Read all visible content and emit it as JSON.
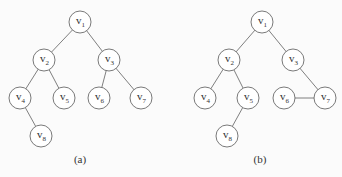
{
  "figures": [
    {
      "id": "a",
      "caption": "(a)",
      "caption_pos": [
        80,
        163
      ],
      "nodes": [
        {
          "id": "v1",
          "base": "v",
          "sub": "1",
          "x": 80,
          "y": 22
        },
        {
          "id": "v2",
          "base": "v",
          "sub": "2",
          "x": 44,
          "y": 60
        },
        {
          "id": "v3",
          "base": "v",
          "sub": "3",
          "x": 109,
          "y": 60
        },
        {
          "id": "v4",
          "base": "v",
          "sub": "4",
          "x": 20,
          "y": 98
        },
        {
          "id": "v5",
          "base": "v",
          "sub": "5",
          "x": 64,
          "y": 98
        },
        {
          "id": "v6",
          "base": "v",
          "sub": "6",
          "x": 99,
          "y": 98
        },
        {
          "id": "v7",
          "base": "v",
          "sub": "7",
          "x": 141,
          "y": 98
        },
        {
          "id": "v8",
          "base": "v",
          "sub": "8",
          "x": 41,
          "y": 136
        }
      ],
      "edges": [
        [
          "v1",
          "v2"
        ],
        [
          "v1",
          "v3"
        ],
        [
          "v2",
          "v4"
        ],
        [
          "v2",
          "v5"
        ],
        [
          "v3",
          "v6"
        ],
        [
          "v3",
          "v7"
        ],
        [
          "v4",
          "v8"
        ]
      ]
    },
    {
      "id": "b",
      "caption": "(b)",
      "caption_pos": [
        260,
        163
      ],
      "nodes": [
        {
          "id": "v1",
          "base": "v",
          "sub": "1",
          "x": 262,
          "y": 22
        },
        {
          "id": "v2",
          "base": "v",
          "sub": "2",
          "x": 229,
          "y": 60
        },
        {
          "id": "v3",
          "base": "v",
          "sub": "3",
          "x": 293,
          "y": 60
        },
        {
          "id": "v4",
          "base": "v",
          "sub": "4",
          "x": 205,
          "y": 98
        },
        {
          "id": "v5",
          "base": "v",
          "sub": "5",
          "x": 248,
          "y": 98
        },
        {
          "id": "v6",
          "base": "v",
          "sub": "6",
          "x": 284,
          "y": 98
        },
        {
          "id": "v7",
          "base": "v",
          "sub": "7",
          "x": 325,
          "y": 98
        },
        {
          "id": "v8",
          "base": "v",
          "sub": "8",
          "x": 227,
          "y": 136
        }
      ],
      "edges": [
        [
          "v1",
          "v2"
        ],
        [
          "v1",
          "v3"
        ],
        [
          "v2",
          "v4"
        ],
        [
          "v2",
          "v5"
        ],
        [
          "v3",
          "v7"
        ],
        [
          "v6",
          "v7"
        ],
        [
          "v5",
          "v8"
        ]
      ]
    }
  ],
  "style": {
    "node_radius": 11,
    "stroke_color": "#6a6a6a",
    "background": "#fbfbfb"
  }
}
